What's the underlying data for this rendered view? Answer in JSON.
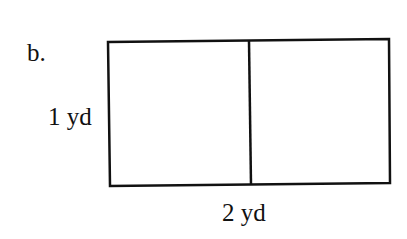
{
  "diagram": {
    "part_label": "b.",
    "height_label": "1 yd",
    "width_label": "2 yd",
    "shape": "rectangle",
    "sections": 2,
    "stroke_color": "#111111",
    "fill_color": "#ffffff"
  }
}
